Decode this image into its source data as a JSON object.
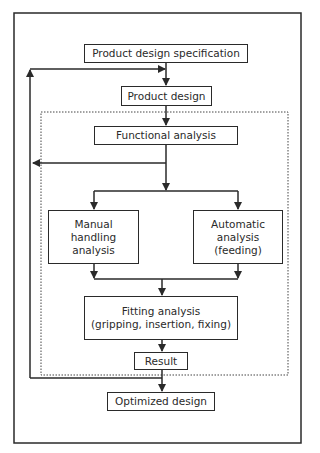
{
  "diagram": {
    "nodes": {
      "spec": "Product design specification",
      "design": "Product design",
      "functional": "Functional analysis",
      "manual": "Manual handling analysis",
      "automatic": "Automatic analysis (feeding)",
      "fitting_line1": "Fitting analysis",
      "fitting_line2": "(gripping, insertion, fixing)",
      "result": "Result",
      "optimized": "Optimized design"
    },
    "manual_lines": [
      "Manual",
      "handling",
      "analysis"
    ],
    "automatic_lines": [
      "Automatic",
      "analysis",
      "(feeding)"
    ],
    "edges": [
      {
        "from": "spec",
        "to": "design"
      },
      {
        "from": "design",
        "to": "functional"
      },
      {
        "from": "functional",
        "to": "feedback-left"
      },
      {
        "from": "functional",
        "to": "manual"
      },
      {
        "from": "functional",
        "to": "automatic"
      },
      {
        "from": "manual",
        "to": "fitting"
      },
      {
        "from": "automatic",
        "to": "fitting"
      },
      {
        "from": "fitting",
        "to": "result"
      },
      {
        "from": "result",
        "to": "optimized"
      },
      {
        "from": "result",
        "to": "design",
        "type": "feedback"
      }
    ],
    "caption": ""
  },
  "colors": {
    "line": "#2a2a2a",
    "background": "#ffffff"
  }
}
